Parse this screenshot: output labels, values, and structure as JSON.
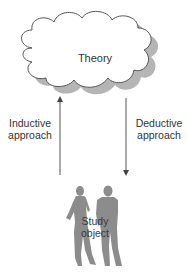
{
  "diagram": {
    "theory": {
      "label": "Theory"
    },
    "inductive": {
      "label_line1": "Inductive",
      "label_line2": "approach",
      "direction": "up"
    },
    "deductive": {
      "label_line1": "Deductive",
      "label_line2": "approach",
      "direction": "down"
    },
    "study_object": {
      "label_line1": "Study",
      "label_line2": "object"
    }
  },
  "colors": {
    "cloud_fill": "#ffffff",
    "cloud_stroke": "#555555",
    "cloud_shadow": "#b0b0b0",
    "arrow": "#555555",
    "silhouette": "#8a8a8a",
    "text": "#333333"
  }
}
